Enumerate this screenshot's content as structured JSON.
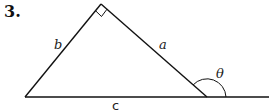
{
  "problem": {
    "number": "3."
  },
  "diagram": {
    "type": "right-triangle-exterior-angle",
    "labels": {
      "a": "a",
      "b": "b",
      "c": "c",
      "theta": "θ"
    },
    "right_angle_at": "apex",
    "exterior_angle_marked": "θ"
  }
}
